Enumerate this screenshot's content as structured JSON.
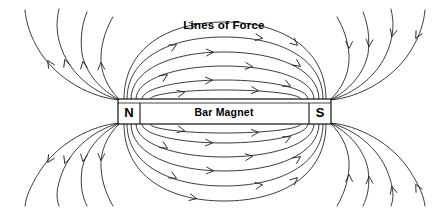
{
  "figure": {
    "title_label": "Lines of Force",
    "magnet_label": "Bar Magnet",
    "north_pole_label": "N",
    "south_pole_label": "S",
    "background_color": "#ffffff",
    "line_color": "#1a1a1a",
    "text_color": "#000000",
    "width": 434,
    "height": 208
  },
  "magnet": {
    "x": 118,
    "y": 99,
    "width": 213,
    "height": 25,
    "inner_rule_offset": 4,
    "north_divider_x": 140,
    "south_divider_x": 309
  },
  "chart_data": {
    "type": "diagram",
    "title": "Lines of Force",
    "subject": "Bar Magnet",
    "poles": [
      {
        "name": "N",
        "side": "left",
        "x": 128,
        "y": 112
      },
      {
        "name": "S",
        "side": "right",
        "x": 321,
        "y": 112
      }
    ],
    "closed_loops": [
      {
        "id": "loop-1",
        "half_width": 118,
        "half_height": 74,
        "arrow_count": 2
      },
      {
        "id": "loop-2",
        "half_width": 106,
        "half_height": 58,
        "arrow_count": 2
      },
      {
        "id": "loop-3",
        "half_width": 94,
        "half_height": 42,
        "arrow_count": 2
      },
      {
        "id": "loop-4",
        "half_width": 82,
        "half_height": 26,
        "arrow_count": 2
      },
      {
        "id": "loop-5",
        "half_width": 70,
        "half_height": 13,
        "arrow_count": 2
      }
    ],
    "open_lines_per_side": 4,
    "flow_direction": "N to S exterior, S to N interior",
    "arrow_style": "open-v chevron"
  },
  "paths": {
    "loops": [
      {
        "name": "field-loop-outer-top",
        "d": "M 124 99 C 124 48 168 22 224 22 C 281 22 326 48 326 99",
        "arrows": [
          {
            "x": 196,
            "y": 24.6,
            "angle": -12
          },
          {
            "x": 297,
            "y": 45,
            "angle": 42
          }
        ]
      },
      {
        "name": "field-loop-second-top",
        "d": "M 127 99 C 127 58 170 37 224 37 C 279 37 323 58 323 99",
        "arrows": [
          {
            "x": 176,
            "y": 45,
            "angle": -28
          },
          {
            "x": 262,
            "y": 38.2,
            "angle": 8
          }
        ]
      },
      {
        "name": "field-loop-third-top",
        "d": "M 131 99 C 131 69 173 52 224 52 C 276 52 319 69 319 99",
        "arrows": [
          {
            "x": 213,
            "y": 52.2,
            "angle": -3
          },
          {
            "x": 300,
            "y": 66,
            "angle": 35
          }
        ]
      },
      {
        "name": "field-loop-fourth-top",
        "d": "M 136 99 C 136 79 176 66 224 66 C 273 66 314 79 314 99",
        "arrows": [
          {
            "x": 167,
            "y": 75,
            "angle": -31
          },
          {
            "x": 252,
            "y": 66.6,
            "angle": 6
          }
        ]
      },
      {
        "name": "field-loop-fifth-top",
        "d": "M 142 99 C 142 88 180 80 224 80 C 269 80 308 88 308 99",
        "arrows": [
          {
            "x": 212,
            "y": 80.1,
            "angle": -3
          },
          {
            "x": 290,
            "y": 86,
            "angle": 26
          }
        ]
      },
      {
        "name": "field-loop-sixth-top",
        "d": "M 150 99 C 150 94 184 90 224 90 C 265 90 301 94 301 99",
        "arrows": [
          {
            "x": 184,
            "y": 92.4,
            "angle": -12
          },
          {
            "x": 258,
            "y": 90.7,
            "angle": 5
          }
        ]
      },
      {
        "name": "field-loop-outer-bottom",
        "d": "M 124 124 C 124 176 168 201 224 201 C 281 201 326 176 326 124",
        "arrows": [
          {
            "x": 196,
            "y": 198.5,
            "angle": 12
          },
          {
            "x": 297,
            "y": 178,
            "angle": -42
          }
        ]
      },
      {
        "name": "field-loop-second-bottom",
        "d": "M 127 124 C 127 165 170 186 224 186 C 279 186 323 165 323 124",
        "arrows": [
          {
            "x": 176,
            "y": 178,
            "angle": 28
          },
          {
            "x": 262,
            "y": 184.8,
            "angle": -8
          }
        ]
      },
      {
        "name": "field-loop-third-bottom",
        "d": "M 131 124 C 131 154 173 171 224 171 C 276 171 319 154 319 124",
        "arrows": [
          {
            "x": 213,
            "y": 170.8,
            "angle": 3
          },
          {
            "x": 300,
            "y": 157,
            "angle": -35
          }
        ]
      },
      {
        "name": "field-loop-fourth-bottom",
        "d": "M 136 124 C 136 144 176 157 224 157 C 273 157 314 144 314 124",
        "arrows": [
          {
            "x": 167,
            "y": 148,
            "angle": 31
          },
          {
            "x": 252,
            "y": 156.4,
            "angle": -6
          }
        ]
      },
      {
        "name": "field-loop-fifth-bottom",
        "d": "M 142 124 C 142 135 180 143 224 143 C 269 143 308 135 308 124",
        "arrows": [
          {
            "x": 212,
            "y": 142.9,
            "angle": 3
          },
          {
            "x": 290,
            "y": 137,
            "angle": -26
          }
        ]
      },
      {
        "name": "field-loop-sixth-bottom",
        "d": "M 150 124 C 150 129 184 133 224 133 C 265 133 301 129 301 124",
        "arrows": [
          {
            "x": 184,
            "y": 130.6,
            "angle": 12
          },
          {
            "x": 258,
            "y": 132.3,
            "angle": -5
          }
        ]
      }
    ],
    "open_left_top": [
      {
        "name": "field-open-left-top-1",
        "d": "M 120 100 C 92 98 58 80 40 52 C 30 36 26 22 25 10",
        "arrows": [
          {
            "x": 48,
            "y": 61,
            "angle": -122
          }
        ]
      },
      {
        "name": "field-open-left-top-2",
        "d": "M 120 100 C 96 94 72 76 62 50 C 56 34 56 22 59 9",
        "arrows": [
          {
            "x": 65,
            "y": 60,
            "angle": -108
          }
        ]
      },
      {
        "name": "field-open-left-top-3",
        "d": "M 120 100 C 100 90 86 73 82 54 C 80 38 82 24 87 12",
        "arrows": [
          {
            "x": 83,
            "y": 62,
            "angle": -99
          }
        ]
      },
      {
        "name": "field-open-left-top-4",
        "d": "M 120 100 C 106 87 100 70 101 55 C 102 40 107 27 113 17",
        "arrows": [
          {
            "x": 101,
            "y": 63,
            "angle": -93
          }
        ]
      }
    ],
    "open_left_bottom": [
      {
        "name": "field-open-left-bottom-1",
        "d": "M 120 123 C 92 125 58 143 40 171 C 30 187 26 197 25 206",
        "arrows": [
          {
            "x": 48,
            "y": 162,
            "angle": 122
          }
        ]
      },
      {
        "name": "field-open-left-bottom-2",
        "d": "M 120 123 C 96 129 72 147 62 173 C 56 189 56 198 59 206",
        "arrows": [
          {
            "x": 65,
            "y": 163,
            "angle": 108
          }
        ]
      },
      {
        "name": "field-open-left-bottom-3",
        "d": "M 120 123 C 100 133 86 150 82 169 C 80 185 82 196 87 206",
        "arrows": [
          {
            "x": 83,
            "y": 161,
            "angle": 99
          }
        ]
      },
      {
        "name": "field-open-left-bottom-4",
        "d": "M 120 123 C 106 136 100 153 101 168 C 102 183 107 196 113 206",
        "arrows": [
          {
            "x": 101,
            "y": 160,
            "angle": 93
          }
        ]
      }
    ],
    "open_right_top": [
      {
        "name": "field-open-right-top-1",
        "d": "M 330 100 C 358 98 392 80 410 52 C 420 36 424 22 425 10",
        "arrows": [
          {
            "x": 416,
            "y": 38,
            "angle": 118
          }
        ]
      },
      {
        "name": "field-open-right-top-2",
        "d": "M 330 100 C 354 94 378 76 388 50 C 394 34 394 22 391 9",
        "arrows": [
          {
            "x": 392,
            "y": 36,
            "angle": 104
          }
        ]
      },
      {
        "name": "field-open-right-top-3",
        "d": "M 330 100 C 350 90 364 73 368 54 C 370 38 368 24 363 12",
        "arrows": [
          {
            "x": 369,
            "y": 46,
            "angle": 95
          }
        ]
      },
      {
        "name": "field-open-right-top-4",
        "d": "M 330 100 C 344 87 350 70 349 55 C 348 40 343 27 337 17",
        "arrows": [
          {
            "x": 349,
            "y": 48,
            "angle": 91
          }
        ]
      }
    ],
    "open_right_bottom": [
      {
        "name": "field-open-right-bottom-1",
        "d": "M 330 123 C 358 125 392 143 410 171 C 420 187 424 197 425 206",
        "arrows": [
          {
            "x": 416,
            "y": 185,
            "angle": -118
          }
        ]
      },
      {
        "name": "field-open-right-bottom-2",
        "d": "M 330 123 C 354 129 378 147 388 173 C 394 189 394 198 391 206",
        "arrows": [
          {
            "x": 392,
            "y": 187,
            "angle": -104
          }
        ]
      },
      {
        "name": "field-open-right-bottom-3",
        "d": "M 330 123 C 350 133 364 150 368 169 C 370 185 368 196 363 206",
        "arrows": [
          {
            "x": 369,
            "y": 177,
            "angle": -95
          }
        ]
      },
      {
        "name": "field-open-right-bottom-4",
        "d": "M 330 123 C 344 136 350 153 349 168 C 348 183 343 196 337 206",
        "arrows": [
          {
            "x": 349,
            "y": 175,
            "angle": -91
          }
        ]
      }
    ]
  }
}
